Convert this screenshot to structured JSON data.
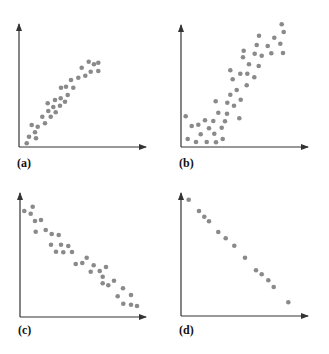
{
  "figure": {
    "dot_color": "#8a8a8a",
    "axis_color": "#333333",
    "label_color": "#111111"
  },
  "chart_data": [
    {
      "type": "scatter",
      "label": "(a)",
      "title": "",
      "xlabel": "",
      "ylabel": "",
      "grid": false,
      "description": "Strong positive, slightly concave (curvilinear) relationship",
      "axes_px": {
        "origin": [
          19,
          147
        ],
        "x_end": 146,
        "y_end": 24
      },
      "points": [
        [
          26.7,
          143.3
        ],
        [
          29,
          136.7
        ],
        [
          35,
          132.3
        ],
        [
          36,
          138.3
        ],
        [
          31.7,
          125
        ],
        [
          37.7,
          126.7
        ],
        [
          42.3,
          116.7
        ],
        [
          45,
          123.3
        ],
        [
          47.7,
          103.3
        ],
        [
          48.3,
          111
        ],
        [
          50.7,
          116.7
        ],
        [
          53.3,
          107
        ],
        [
          55.7,
          112.3
        ],
        [
          55,
          100
        ],
        [
          60,
          105.7
        ],
        [
          60.7,
          98.3
        ],
        [
          61,
          87.7
        ],
        [
          65,
          101.7
        ],
        [
          66,
          86.7
        ],
        [
          67.7,
          95
        ],
        [
          71,
          80
        ],
        [
          73.3,
          87.7
        ],
        [
          78.3,
          77.7
        ],
        [
          81.7,
          67.7
        ],
        [
          85.3,
          75.7
        ],
        [
          88.7,
          61.7
        ],
        [
          90.7,
          71.7
        ],
        [
          94,
          64.3
        ],
        [
          98.3,
          62.7
        ],
        [
          98.3,
          71
        ]
      ]
    },
    {
      "type": "scatter",
      "label": "(b)",
      "title": "",
      "xlabel": "",
      "ylabel": "",
      "grid": false,
      "description": "Positive relationship, flat at low x then increasing, more scattered",
      "axes_px": {
        "origin": [
          181,
          147
        ],
        "x_end": 308,
        "y_end": 25
      },
      "points": [
        [
          185.7,
          116.3
        ],
        [
          187.7,
          139
        ],
        [
          191.7,
          126
        ],
        [
          196,
          142
        ],
        [
          198.3,
          124.7
        ],
        [
          200.7,
          134.3
        ],
        [
          205,
          120.3
        ],
        [
          206.7,
          142
        ],
        [
          209,
          128.3
        ],
        [
          213.3,
          121
        ],
        [
          214.3,
          133.7
        ],
        [
          215.7,
          101.3
        ],
        [
          216,
          142.3
        ],
        [
          218.3,
          112.7
        ],
        [
          221.7,
          127.7
        ],
        [
          222.7,
          139
        ],
        [
          225,
          121.3
        ],
        [
          227,
          113.7
        ],
        [
          227.3,
          102.7
        ],
        [
          230.3,
          94.7
        ],
        [
          230.3,
          70.3
        ],
        [
          232.7,
          79.3
        ],
        [
          234,
          105.7
        ],
        [
          236.7,
          90
        ],
        [
          239.3,
          118.3
        ],
        [
          240.7,
          99.7
        ],
        [
          240.3,
          73.7
        ],
        [
          243,
          57.3
        ],
        [
          243.7,
          50.7
        ],
        [
          246.7,
          85.3
        ],
        [
          247.3,
          73.7
        ],
        [
          249,
          64.3
        ],
        [
          254.3,
          77.3
        ],
        [
          254.7,
          53.7
        ],
        [
          256.7,
          45
        ],
        [
          258.7,
          66
        ],
        [
          259,
          35.7
        ],
        [
          261.7,
          55.7
        ],
        [
          267.7,
          46
        ],
        [
          271.3,
          53.3
        ],
        [
          274.3,
          37.7
        ],
        [
          280.3,
          43.7
        ],
        [
          281.7,
          24.3
        ],
        [
          283.7,
          32
        ],
        [
          283,
          53
        ]
      ]
    },
    {
      "type": "scatter",
      "label": "(c)",
      "title": "",
      "xlabel": "",
      "ylabel": "",
      "grid": false,
      "description": "Strong negative linear relationship with moderate scatter",
      "axes_px": {
        "origin": [
          20,
          317
        ],
        "x_end": 146,
        "y_end": 193
      },
      "points": [
        [
          24.3,
          211
        ],
        [
          30.7,
          213.7
        ],
        [
          32.7,
          206.7
        ],
        [
          35,
          221
        ],
        [
          41,
          220
        ],
        [
          35.7,
          231.7
        ],
        [
          45.7,
          230
        ],
        [
          51.7,
          234
        ],
        [
          58.7,
          235
        ],
        [
          51,
          244.7
        ],
        [
          61,
          244.7
        ],
        [
          68.3,
          246
        ],
        [
          56,
          251.7
        ],
        [
          63.3,
          252.3
        ],
        [
          72,
          252
        ],
        [
          75.7,
          264
        ],
        [
          82.3,
          263
        ],
        [
          86.7,
          257.7
        ],
        [
          93.7,
          265.3
        ],
        [
          90.7,
          271.7
        ],
        [
          99.7,
          271
        ],
        [
          106,
          267
        ],
        [
          102.7,
          276.7
        ],
        [
          102.7,
          283.3
        ],
        [
          108.3,
          285.3
        ],
        [
          114,
          280.7
        ],
        [
          123,
          288.3
        ],
        [
          117.7,
          296.3
        ],
        [
          123.3,
          303.7
        ],
        [
          131,
          295
        ],
        [
          131,
          304.7
        ],
        [
          137,
          306
        ]
      ]
    },
    {
      "type": "scatter",
      "label": "(d)",
      "title": "",
      "xlabel": "",
      "ylabel": "",
      "grid": false,
      "description": "Near-perfect negative linear relationship",
      "axes_px": {
        "origin": [
          181,
          316
        ],
        "x_end": 308,
        "y_end": 193
      },
      "points": [
        [
          188.7,
          199.7
        ],
        [
          199,
          211
        ],
        [
          204.3,
          216.7
        ],
        [
          209,
          221.3
        ],
        [
          218.3,
          232
        ],
        [
          225.7,
          238.3
        ],
        [
          234.3,
          245.7
        ],
        [
          245,
          257.7
        ],
        [
          256,
          270.3
        ],
        [
          261.7,
          274.3
        ],
        [
          268.3,
          280.3
        ],
        [
          273.7,
          287
        ],
        [
          288.3,
          302.3
        ]
      ]
    }
  ],
  "labels": {
    "a": "(a)",
    "b": "(b)",
    "c": "(c)",
    "d": "(d)"
  }
}
